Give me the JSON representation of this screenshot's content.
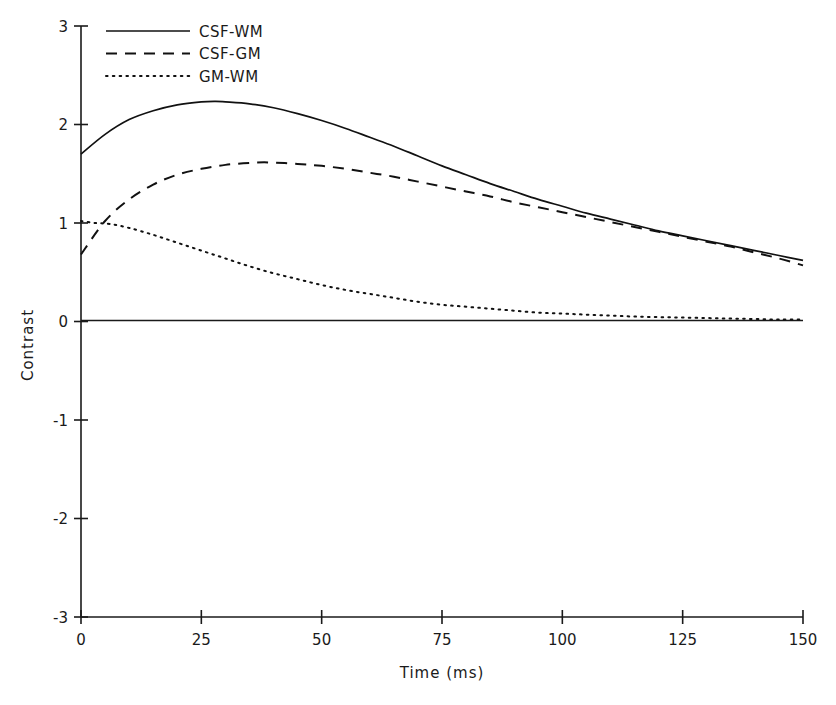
{
  "chart_data": {
    "type": "line",
    "title": "",
    "xlabel": "Time  (ms)",
    "ylabel": "Contrast",
    "xlim": [
      0,
      150
    ],
    "ylim": [
      -3,
      3
    ],
    "xticks": [
      0,
      25,
      50,
      75,
      100,
      125,
      150
    ],
    "xtick_labels": [
      "0",
      "25",
      "50",
      "75",
      "100",
      "125",
      "150"
    ],
    "yticks": [
      -3,
      -2,
      -1,
      0,
      1,
      2,
      3
    ],
    "ytick_labels": [
      "-3",
      "-2",
      "-1",
      "0",
      "1",
      "2",
      "3"
    ],
    "grid": false,
    "legend_position": "top-left-inside",
    "zero_reference_line": 0,
    "series": [
      {
        "name": "CSF-WM",
        "style": "solid",
        "color": "#111111",
        "x": [
          0,
          5,
          10,
          15,
          20,
          25,
          28,
          30,
          35,
          40,
          45,
          50,
          55,
          60,
          65,
          70,
          75,
          80,
          85,
          90,
          95,
          100,
          105,
          110,
          115,
          120,
          125,
          130,
          135,
          140,
          145,
          150
        ],
        "y": [
          1.7,
          1.9,
          2.05,
          2.14,
          2.2,
          2.23,
          2.235,
          2.23,
          2.21,
          2.17,
          2.11,
          2.04,
          1.96,
          1.87,
          1.78,
          1.68,
          1.58,
          1.49,
          1.4,
          1.32,
          1.24,
          1.17,
          1.1,
          1.04,
          0.98,
          0.92,
          0.87,
          0.82,
          0.77,
          0.72,
          0.67,
          0.62
        ]
      },
      {
        "name": "CSF-GM",
        "style": "dashed",
        "color": "#111111",
        "x": [
          0,
          5,
          10,
          15,
          20,
          25,
          30,
          35,
          39,
          45,
          50,
          55,
          60,
          65,
          70,
          75,
          80,
          85,
          90,
          95,
          100,
          105,
          110,
          115,
          120,
          125,
          130,
          135,
          140,
          145,
          150
        ],
        "y": [
          0.68,
          1.02,
          1.24,
          1.39,
          1.49,
          1.55,
          1.59,
          1.61,
          1.615,
          1.6,
          1.58,
          1.55,
          1.51,
          1.47,
          1.42,
          1.37,
          1.32,
          1.27,
          1.21,
          1.16,
          1.11,
          1.06,
          1.01,
          0.96,
          0.91,
          0.86,
          0.81,
          0.76,
          0.7,
          0.64,
          0.57
        ]
      },
      {
        "name": "GM-WM",
        "style": "dotted",
        "color": "#111111",
        "x": [
          0,
          3,
          6,
          10,
          15,
          20,
          25,
          30,
          35,
          40,
          45,
          50,
          55,
          60,
          65,
          70,
          75,
          80,
          85,
          90,
          95,
          100,
          105,
          110,
          115,
          120,
          125,
          130,
          135,
          140,
          145,
          150
        ],
        "y": [
          1.02,
          1.0,
          0.99,
          0.95,
          0.88,
          0.8,
          0.72,
          0.64,
          0.56,
          0.49,
          0.43,
          0.37,
          0.32,
          0.28,
          0.24,
          0.2,
          0.17,
          0.15,
          0.13,
          0.11,
          0.09,
          0.08,
          0.07,
          0.06,
          0.05,
          0.045,
          0.04,
          0.035,
          0.03,
          0.025,
          0.02,
          0.02
        ]
      }
    ]
  },
  "axes": {
    "x_title": "Time  (ms)",
    "y_title": "Contrast"
  },
  "legend": {
    "entries": [
      {
        "label": "CSF-WM",
        "style": "solid"
      },
      {
        "label": "CSF-GM",
        "style": "dashed"
      },
      {
        "label": "GM-WM",
        "style": "dotted"
      }
    ]
  },
  "colors": {
    "line": "#111111",
    "axis": "#1a1a1a",
    "background": "#ffffff"
  }
}
